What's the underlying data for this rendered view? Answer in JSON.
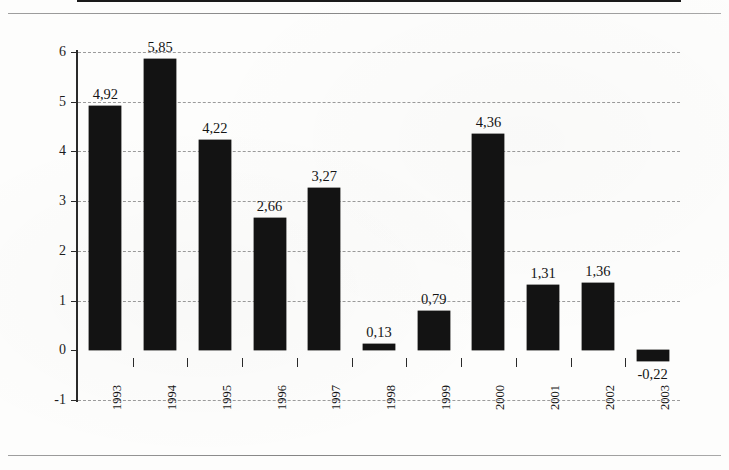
{
  "chart_data": {
    "type": "bar",
    "title": "",
    "subtitle": "",
    "xlabel": "",
    "ylabel": "",
    "categories": [
      "1993",
      "1994",
      "1995",
      "1996",
      "1997",
      "1998",
      "1999",
      "2000",
      "2001",
      "2002",
      "2003"
    ],
    "values": [
      4.92,
      5.85,
      4.22,
      2.66,
      3.27,
      0.13,
      0.79,
      4.36,
      1.31,
      1.36,
      -0.22
    ],
    "value_labels": [
      "4,92",
      "5,85",
      "4,22",
      "2,66",
      "3,27",
      "0,13",
      "0,79",
      "4,36",
      "1,31",
      "1,36",
      "-0,22"
    ],
    "decimal_separator": ",",
    "ylim": [
      -1,
      6
    ],
    "y_ticks": [
      6,
      5,
      4,
      3,
      2,
      1,
      0,
      -1
    ],
    "y_tick_labels": [
      "6",
      "5",
      "4",
      "3",
      "2",
      "1",
      "0",
      "-1"
    ],
    "grid": true,
    "grid_style": "dashed-horizontal",
    "legend": null,
    "legend_position": "none",
    "series": [
      {
        "name": "",
        "values": [
          4.92,
          5.85,
          4.22,
          2.66,
          3.27,
          0.13,
          0.79,
          4.36,
          1.31,
          1.36,
          -0.22
        ]
      }
    ],
    "bar_color": "#131313",
    "grid_color": "#9b9b9b",
    "axis_color": "#2a2a2a",
    "text_color": "#151515",
    "background_color": "#fdfdfc",
    "x_tick_labels_rotation_deg": -90,
    "value_labels_shown": true
  }
}
